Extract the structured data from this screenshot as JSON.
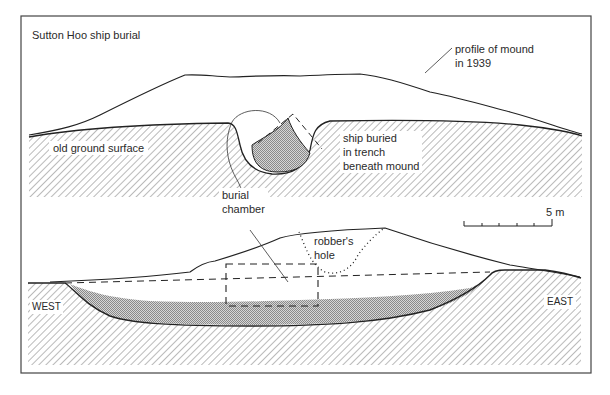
{
  "figure": {
    "title": "Sutton Hoo ship burial",
    "upper_section": {
      "labels": {
        "mound_profile": [
          "profile of mound",
          "in 1939"
        ],
        "ground_surface": "old ground surface",
        "ship_trench": [
          "ship buried",
          "in trench",
          "beneath mound"
        ],
        "burial_chamber": [
          "burial",
          "chamber"
        ]
      }
    },
    "lower_section": {
      "labels": {
        "robbers_hole": [
          "robber's",
          "hole"
        ],
        "west": "WEST",
        "east": "EAST"
      }
    },
    "scale_bar": {
      "label": "5 m",
      "ticks": 5
    },
    "colors": {
      "line": "#2a2a2a",
      "hatch": "#555555",
      "ship_fill": "#bdbdbd",
      "frame": "#444444"
    }
  }
}
